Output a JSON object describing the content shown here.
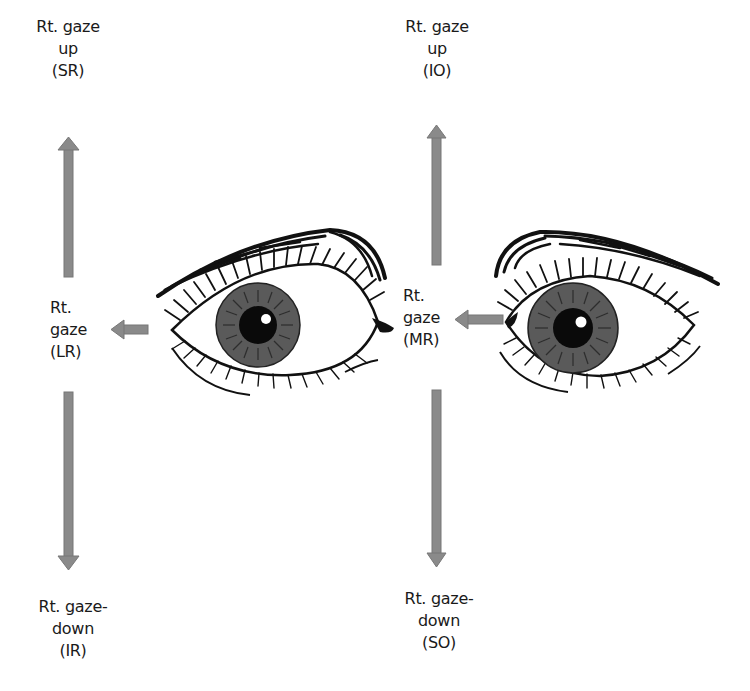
{
  "diagram": {
    "arrow_color": "#8a8a8a",
    "iris_color": "#5a5a5a",
    "left_column": {
      "up": {
        "lines": [
          "Rt. gaze",
          "up",
          "(SR)"
        ]
      },
      "side": {
        "lines": [
          "Rt.",
          "gaze",
          "(LR)"
        ]
      },
      "down": {
        "lines": [
          "Rt. gaze-",
          "down",
          "(IR)"
        ]
      }
    },
    "right_column": {
      "up": {
        "lines": [
          "Rt. gaze",
          "up",
          "(IO)"
        ]
      },
      "side": {
        "lines": [
          "Rt.",
          "gaze",
          "(MR)"
        ]
      },
      "down": {
        "lines": [
          "Rt. gaze-",
          "down",
          "(SO)"
        ]
      }
    }
  }
}
